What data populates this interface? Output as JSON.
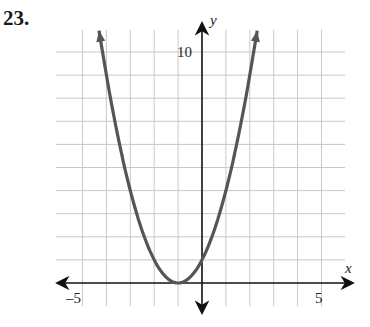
{
  "problem": {
    "number": "23."
  },
  "chart_data": {
    "type": "line",
    "title": "",
    "function": "y = (x + 1)^2",
    "xlabel": "x",
    "ylabel": "y",
    "xlim": [
      -6,
      6
    ],
    "ylim": [
      -1,
      11
    ],
    "grid": true,
    "tick_labels": {
      "x": [
        {
          "value": -5,
          "label": "–5"
        },
        {
          "value": 5,
          "label": "5"
        }
      ],
      "y": [
        {
          "value": 10,
          "label": "10"
        }
      ]
    },
    "series": [
      {
        "name": "parabola",
        "color": "#555555",
        "x": [
          -4.16,
          -4,
          -3.5,
          -3,
          -2.5,
          -2,
          -1.5,
          -1,
          -0.5,
          0,
          0.5,
          1,
          1.5,
          2,
          2.16
        ],
        "y": [
          10,
          9,
          6.25,
          4,
          2.25,
          1,
          0.25,
          0,
          0.25,
          1,
          2.25,
          4,
          6.25,
          9,
          10
        ],
        "vertex": [
          -1,
          0
        ],
        "arrows_at_ends": true
      }
    ]
  },
  "colors": {
    "curve": "#555555",
    "axis": "#111111",
    "grid": "#c8c8c8"
  }
}
